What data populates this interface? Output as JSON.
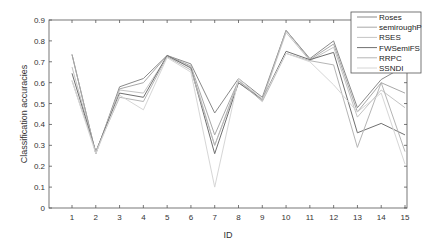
{
  "chart_data": {
    "type": "line",
    "title": "",
    "xlabel": "ID",
    "ylabel": "Classification accuracies",
    "x": [
      1,
      2,
      3,
      4,
      5,
      6,
      7,
      8,
      9,
      10,
      11,
      12,
      13,
      14,
      15
    ],
    "xlim": [
      0,
      15.1
    ],
    "ylim": [
      0,
      0.9
    ],
    "yticks": [
      0,
      0.1,
      0.2,
      0.3,
      0.4,
      0.5,
      0.6,
      0.7,
      0.8,
      0.9
    ],
    "xticks": [
      1,
      2,
      3,
      4,
      5,
      6,
      7,
      8,
      9,
      10,
      11,
      12,
      13,
      14,
      15
    ],
    "grid": false,
    "legend_position": "top-right",
    "series": [
      {
        "name": "Roses",
        "color": "#8a8a8a",
        "values": [
          0.735,
          0.26,
          0.58,
          0.62,
          0.73,
          0.69,
          0.455,
          0.62,
          0.53,
          0.85,
          0.715,
          0.8,
          0.48,
          0.615,
          0.68
        ]
      },
      {
        "name": "semiroughP",
        "color": "#a8a8a8",
        "values": [
          0.735,
          0.26,
          0.57,
          0.6,
          0.73,
          0.68,
          0.35,
          0.61,
          0.52,
          0.85,
          0.71,
          0.785,
          0.46,
          0.6,
          0.55
        ]
      },
      {
        "name": "RSES",
        "color": "#c4c4c4",
        "values": [
          0.675,
          0.265,
          0.565,
          0.55,
          0.725,
          0.675,
          0.3,
          0.6,
          0.515,
          0.84,
          0.705,
          0.77,
          0.435,
          0.565,
          0.48
        ]
      },
      {
        "name": "FWSemiFS",
        "color": "#707070",
        "values": [
          0.645,
          0.27,
          0.55,
          0.53,
          0.73,
          0.67,
          0.26,
          0.6,
          0.52,
          0.75,
          0.71,
          0.745,
          0.36,
          0.405,
          0.35
        ]
      },
      {
        "name": "RRPC",
        "color": "#b5b5b5",
        "values": [
          0.61,
          0.27,
          0.53,
          0.51,
          0.725,
          0.66,
          0.3,
          0.61,
          0.51,
          0.74,
          0.705,
          0.685,
          0.29,
          0.6,
          0.27
        ]
      },
      {
        "name": "SSNDI",
        "color": "#d6d6d6",
        "values": [
          0.61,
          0.26,
          0.54,
          0.47,
          0.72,
          0.65,
          0.1,
          0.62,
          0.52,
          0.74,
          0.7,
          0.59,
          0.46,
          0.55,
          0.21
        ]
      }
    ]
  }
}
